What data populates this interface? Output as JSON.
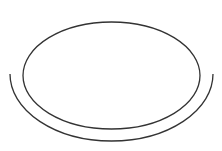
{
  "figure": {
    "background": "#ffffff",
    "stroke_color": "#333333",
    "stroke_width": 1.3,
    "shapes": [
      {
        "name": "top-ellipse",
        "type": "ellipse",
        "cx": 111.5,
        "cy": 75.5,
        "rx": 88.5,
        "ry": 53.5
      },
      {
        "name": "rim-arc",
        "type": "lower-half-ellipse-arc",
        "cx": 111.5,
        "cy": 74,
        "rx": 101.5,
        "ry": 67,
        "start": [
          10,
          74
        ],
        "end": [
          213,
          74
        ]
      }
    ]
  }
}
